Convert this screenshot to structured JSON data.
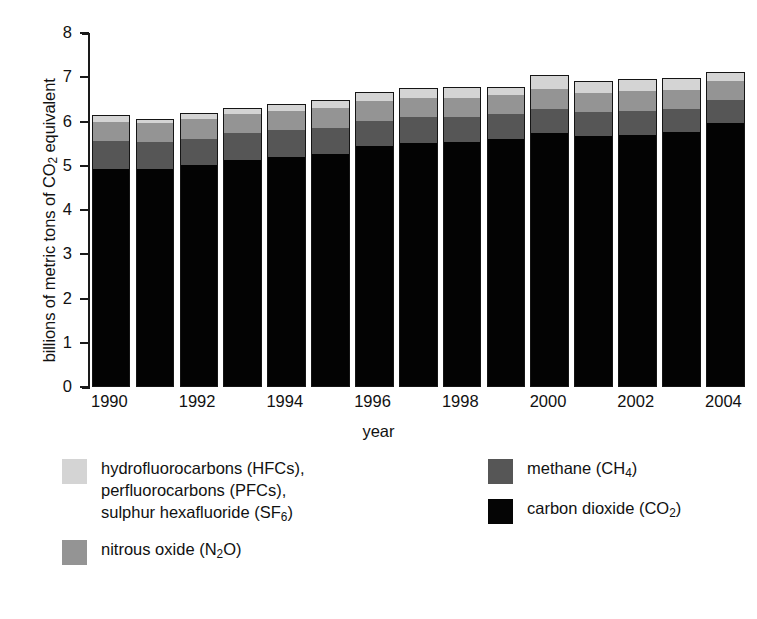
{
  "chart_data": {
    "type": "bar",
    "subtype": "stacked-bar",
    "title": "",
    "xlabel": "year",
    "ylabel": "billions of metric tons of CO2 equivalent",
    "ylim": [
      0,
      8
    ],
    "yticks": [
      0,
      1,
      2,
      3,
      4,
      5,
      6,
      7,
      8
    ],
    "ytick_labels": [
      "0",
      "1",
      "2",
      "3",
      "4",
      "5",
      "6",
      "7",
      "8"
    ],
    "grid": false,
    "legend_position": "below-plot",
    "categories": [
      1990,
      1991,
      1992,
      1993,
      1994,
      1995,
      1996,
      1997,
      1998,
      1999,
      2000,
      2001,
      2002,
      2003,
      2004
    ],
    "xtick_labels": [
      "1990",
      "",
      "1992",
      "",
      "1994",
      "",
      "1996",
      "",
      "1998",
      "",
      "2000",
      "",
      "2002",
      "",
      "2004"
    ],
    "series": [
      {
        "name": "carbon dioxide (CO2)",
        "key": "co2",
        "color": "#030303",
        "values": [
          4.95,
          4.93,
          5.02,
          5.15,
          5.22,
          5.27,
          5.45,
          5.53,
          5.55,
          5.63,
          5.75,
          5.68,
          5.72,
          5.77,
          5.98
        ]
      },
      {
        "name": "methane (CH4)",
        "key": "ch4",
        "color": "#565656",
        "values": [
          0.62,
          0.62,
          0.61,
          0.6,
          0.6,
          0.6,
          0.59,
          0.58,
          0.57,
          0.56,
          0.55,
          0.55,
          0.54,
          0.53,
          0.53
        ]
      },
      {
        "name": "nitrous oxide (N2O)",
        "key": "n2o",
        "color": "#949494",
        "values": [
          0.44,
          0.43,
          0.44,
          0.44,
          0.44,
          0.45,
          0.44,
          0.44,
          0.44,
          0.43,
          0.45,
          0.44,
          0.44,
          0.43,
          0.43
        ]
      },
      {
        "name": "hydrofluorocarbons (HFCs), perfluorocarbons (PFCs), sulphur hexafluoride (SF6)",
        "key": "fgas",
        "color": "#d4d4d4",
        "values": [
          0.14,
          0.08,
          0.13,
          0.12,
          0.13,
          0.17,
          0.19,
          0.21,
          0.23,
          0.17,
          0.3,
          0.25,
          0.25,
          0.26,
          0.17
        ]
      }
    ],
    "totals": [
      6.15,
      6.06,
      6.2,
      6.31,
      6.39,
      6.49,
      6.67,
      6.76,
      6.79,
      6.79,
      7.05,
      6.92,
      6.95,
      6.99,
      7.11
    ]
  },
  "axes": {
    "y_title": "billions of metric tons of CO",
    "y_title_sub": "2",
    "y_title_tail": " equivalent",
    "x_title": "year"
  },
  "legend": {
    "left": [
      {
        "name": "legend-item-fgas",
        "swatch": "fgas",
        "lines": [
          "hydrofluorocarbons (HFCs),",
          "perfluorocarbons (PFCs),",
          "sulphur hexafluoride (SF6)"
        ]
      },
      {
        "name": "legend-item-n2o",
        "swatch": "n2o",
        "lines": [
          "nitrous oxide (N2O)"
        ]
      }
    ],
    "right": [
      {
        "name": "legend-item-ch4",
        "swatch": "ch4",
        "lines": [
          "methane (CH4)"
        ]
      },
      {
        "name": "legend-item-co2",
        "swatch": "co2",
        "lines": [
          "carbon dioxide (CO2)"
        ]
      }
    ]
  }
}
